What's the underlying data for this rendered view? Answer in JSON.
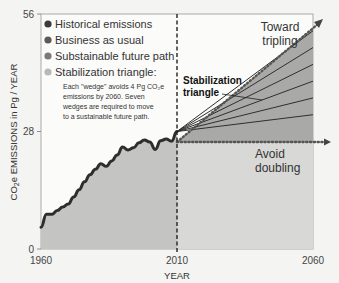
{
  "chart_data": {
    "type": "area",
    "title": "",
    "xlabel": "YEAR",
    "ylabel": "CO2e EMISSIONS in Pg / YEAR",
    "xlim": [
      1960,
      2060
    ],
    "ylim": [
      0,
      56
    ],
    "x_ticks": [
      "1960",
      "2010",
      "2060"
    ],
    "y_ticks": [
      "0",
      "28",
      "56"
    ],
    "legend": [
      {
        "label": "Historical emissions",
        "color": "#3a3a3a"
      },
      {
        "label": "Business as usual",
        "color": "#5a5a5a"
      },
      {
        "label": "Substainable future path",
        "color": "#7a7a7a"
      },
      {
        "label": "Stabilization triangle:",
        "color": "#b8b8b8"
      }
    ],
    "legend_note": [
      "Each \"wedge\" avoids 4 Pg CO₂e",
      "emissions by 2060. Seven",
      "wedges are required to move",
      "to a sustainable future path."
    ],
    "series": [
      {
        "name": "Historical emissions",
        "x": [
          1960,
          1962,
          1964,
          1966,
          1968,
          1970,
          1972,
          1974,
          1976,
          1978,
          1980,
          1982,
          1984,
          1986,
          1988,
          1990,
          1992,
          1994,
          1996,
          1998,
          2000,
          2002,
          2004,
          2006,
          2008,
          2010
        ],
        "values": [
          5.2,
          8.3,
          8.3,
          9.2,
          10,
          10.7,
          12.4,
          14.1,
          16,
          17.7,
          19,
          20.3,
          19.7,
          21,
          22.4,
          24.3,
          23.6,
          24.1,
          25.3,
          26,
          25.5,
          23.7,
          25.8,
          26.2,
          25.7,
          28
        ]
      },
      {
        "name": "Business as usual",
        "x": [
          2010,
          2060
        ],
        "values": [
          28,
          56
        ]
      },
      {
        "name": "Substainable future path",
        "x": [
          2010,
          2060
        ],
        "values": [
          28,
          28
        ]
      }
    ],
    "stabilization_wedges": {
      "count": 7,
      "per_wedge_pg": 4,
      "end_values_2060": [
        56,
        52,
        48,
        44,
        40,
        36,
        32,
        28
      ]
    },
    "annotations": [
      "Toward tripling",
      "Stabilization triangle",
      "Avoid doubling"
    ],
    "vertical_marker": {
      "x": 2010,
      "style": "dashed"
    }
  },
  "labels": {
    "toward": [
      "Toward",
      "tripling"
    ],
    "stab": [
      "Stabilization",
      "triangle"
    ],
    "avoid": [
      "Avoid",
      "doubling"
    ]
  }
}
